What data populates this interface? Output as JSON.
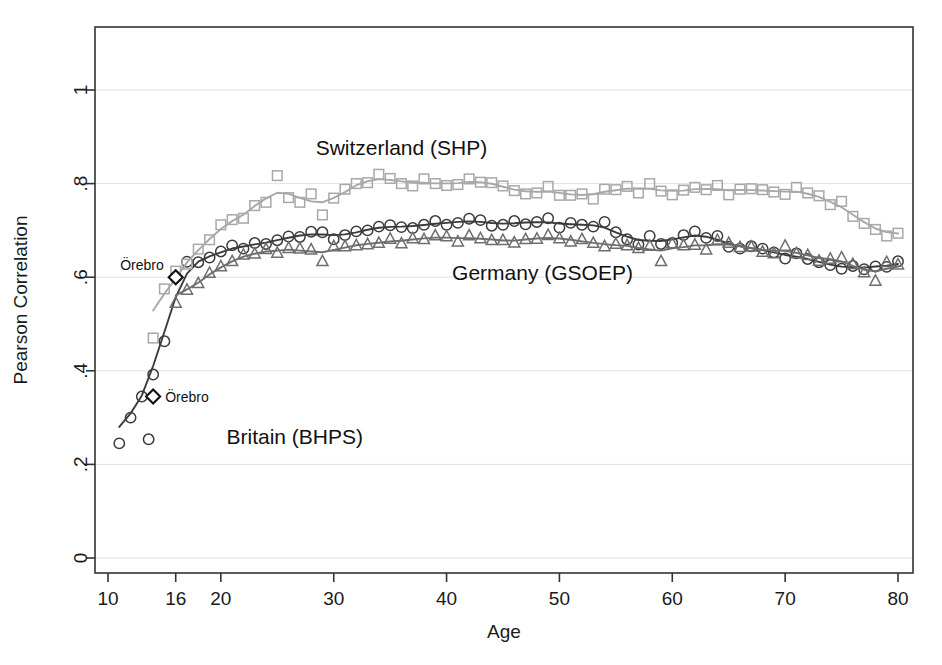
{
  "chart_data": {
    "type": "scatter",
    "title": "",
    "xlabel": "Age",
    "ylabel": "Pearson Correlation",
    "xlim": [
      9,
      81
    ],
    "ylim": [
      0,
      1.12
    ],
    "xticks": [
      "10",
      "16",
      "20",
      "30",
      "40",
      "50",
      "60",
      "70",
      "80"
    ],
    "xtick_values": [
      10,
      16,
      20,
      30,
      40,
      50,
      60,
      70,
      80
    ],
    "yticks": [
      "0",
      ".2",
      ".4",
      ".6",
      ".8",
      "1"
    ],
    "ytick_values": [
      0,
      0.2,
      0.4,
      0.6,
      0.8,
      1.0
    ],
    "grid": true,
    "legend_position": "inline-labels",
    "series": [
      {
        "name": "Britain (BHPS)",
        "marker": "circle",
        "color": "#3b3b3b",
        "label_x": 20.5,
        "label_y": 0.243,
        "marker_legend_x": 13.6,
        "x": [
          11,
          12,
          13,
          14,
          15,
          16,
          17,
          18,
          19,
          20,
          21,
          22,
          23,
          24,
          25,
          26,
          27,
          28,
          29,
          30,
          31,
          32,
          33,
          34,
          35,
          36,
          37,
          38,
          39,
          40,
          41,
          42,
          43,
          44,
          45,
          46,
          47,
          48,
          49,
          50,
          51,
          52,
          53,
          54,
          55,
          56,
          57,
          58,
          59,
          60,
          61,
          62,
          63,
          64,
          65,
          66,
          67,
          68,
          69,
          70,
          71,
          72,
          73,
          74,
          75,
          76,
          77,
          78,
          79,
          80
        ],
        "y": [
          0.245,
          0.3,
          0.345,
          0.392,
          0.463,
          0.6,
          0.633,
          0.632,
          0.642,
          0.655,
          0.668,
          0.661,
          0.673,
          0.671,
          0.679,
          0.687,
          0.686,
          0.697,
          0.696,
          0.681,
          0.69,
          0.698,
          0.7,
          0.708,
          0.711,
          0.707,
          0.705,
          0.712,
          0.72,
          0.712,
          0.716,
          0.725,
          0.722,
          0.71,
          0.712,
          0.72,
          0.713,
          0.718,
          0.726,
          0.706,
          0.716,
          0.712,
          0.708,
          0.718,
          0.696,
          0.681,
          0.67,
          0.688,
          0.671,
          0.673,
          0.69,
          0.698,
          0.684,
          0.688,
          0.665,
          0.661,
          0.666,
          0.661,
          0.653,
          0.64,
          0.651,
          0.639,
          0.632,
          0.626,
          0.618,
          0.624,
          0.617,
          0.623,
          0.622,
          0.634
        ]
      },
      {
        "name": "Switzerland (SHP)",
        "marker": "square",
        "color": "#a8a8a8",
        "label_x": 36.0,
        "label_y": 0.862,
        "x": [
          14,
          15,
          16,
          17,
          18,
          19,
          20,
          21,
          22,
          23,
          24,
          25,
          26,
          27,
          28,
          29,
          30,
          31,
          32,
          33,
          34,
          35,
          36,
          37,
          38,
          39,
          40,
          41,
          42,
          43,
          44,
          45,
          46,
          47,
          48,
          49,
          50,
          51,
          52,
          53,
          54,
          55,
          56,
          57,
          58,
          59,
          60,
          61,
          62,
          63,
          64,
          65,
          66,
          67,
          68,
          69,
          70,
          71,
          72,
          73,
          74,
          75,
          76,
          77,
          78,
          79,
          80
        ],
        "y": [
          0.47,
          0.575,
          0.613,
          0.628,
          0.66,
          0.68,
          0.712,
          0.723,
          0.726,
          0.753,
          0.76,
          0.817,
          0.77,
          0.76,
          0.778,
          0.733,
          0.769,
          0.788,
          0.8,
          0.802,
          0.82,
          0.811,
          0.8,
          0.795,
          0.81,
          0.8,
          0.796,
          0.798,
          0.81,
          0.803,
          0.802,
          0.795,
          0.785,
          0.778,
          0.78,
          0.794,
          0.775,
          0.775,
          0.778,
          0.767,
          0.788,
          0.787,
          0.794,
          0.78,
          0.8,
          0.784,
          0.776,
          0.786,
          0.792,
          0.787,
          0.796,
          0.776,
          0.788,
          0.789,
          0.787,
          0.782,
          0.777,
          0.792,
          0.78,
          0.774,
          0.755,
          0.762,
          0.73,
          0.715,
          0.702,
          0.688,
          0.694
        ]
      },
      {
        "name": "Germany (GSOEP)",
        "marker": "triangle",
        "color": "#6e6e6e",
        "label_x": 48.5,
        "label_y": 0.595,
        "x": [
          16,
          17,
          18,
          19,
          20,
          21,
          22,
          23,
          24,
          25,
          26,
          27,
          28,
          29,
          30,
          31,
          32,
          33,
          34,
          35,
          36,
          37,
          38,
          39,
          40,
          41,
          42,
          43,
          44,
          45,
          46,
          47,
          48,
          49,
          50,
          51,
          52,
          53,
          54,
          55,
          56,
          57,
          58,
          59,
          60,
          61,
          62,
          63,
          64,
          65,
          66,
          67,
          68,
          69,
          70,
          71,
          72,
          73,
          74,
          75,
          76,
          77,
          78,
          79,
          80
        ],
        "y": [
          0.545,
          0.573,
          0.587,
          0.609,
          0.623,
          0.634,
          0.648,
          0.65,
          0.66,
          0.652,
          0.662,
          0.661,
          0.659,
          0.634,
          0.666,
          0.666,
          0.668,
          0.67,
          0.673,
          0.682,
          0.672,
          0.683,
          0.681,
          0.689,
          0.687,
          0.676,
          0.689,
          0.683,
          0.679,
          0.679,
          0.674,
          0.681,
          0.682,
          0.69,
          0.683,
          0.676,
          0.681,
          0.673,
          0.666,
          0.671,
          0.668,
          0.662,
          0.667,
          0.634,
          0.672,
          0.668,
          0.669,
          0.659,
          0.679,
          0.673,
          0.664,
          0.665,
          0.654,
          0.651,
          0.667,
          0.651,
          0.647,
          0.635,
          0.639,
          0.642,
          0.628,
          0.61,
          0.592,
          0.632,
          0.627
        ]
      }
    ],
    "annotations": [
      {
        "text": "Örebro",
        "marker": "diamond",
        "x": 16.0,
        "y": 0.6,
        "text_side": "left"
      },
      {
        "text": "Örebro",
        "marker": "diamond",
        "x": 14.0,
        "y": 0.345,
        "text_side": "right"
      }
    ]
  },
  "axes": {
    "x_title": "Age",
    "y_title": "Pearson Correlation"
  }
}
